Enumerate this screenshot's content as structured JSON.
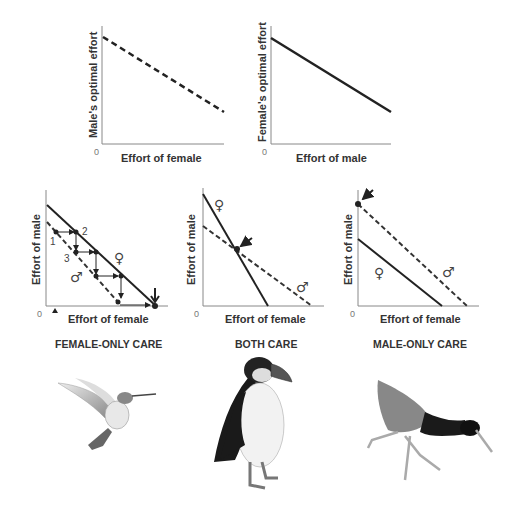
{
  "figure": {
    "top_panels": [
      {
        "id": "male-reaction",
        "ylabel": "Male's optimal effort",
        "xlabel": "Effort of female",
        "origin": "0",
        "line": "dashed"
      },
      {
        "id": "female-reaction",
        "ylabel": "Female's optimal effort",
        "xlabel": "Effort of male",
        "origin": "0",
        "line": "solid"
      }
    ],
    "bottom_panels": [
      {
        "id": "female-only",
        "ylabel": "Effort of male",
        "xlabel": "Effort of female",
        "origin": "0",
        "caption": "FEMALE-ONLY CARE",
        "step_labels": [
          "1",
          "2",
          "3"
        ],
        "female_symbol": "♀",
        "male_symbol": "♂",
        "bird": "hummingbird"
      },
      {
        "id": "both",
        "ylabel": "Effort of male",
        "xlabel": "Effort of female",
        "origin": "0",
        "caption": "BOTH CARE",
        "female_symbol": "♀",
        "male_symbol": "♂",
        "bird": "puffin"
      },
      {
        "id": "male-only",
        "ylabel": "Effort of male",
        "xlabel": "Effort of female",
        "origin": "0",
        "caption": "MALE-ONLY CARE",
        "female_symbol": "♀",
        "male_symbol": "♂",
        "bird": "jacana"
      }
    ]
  }
}
